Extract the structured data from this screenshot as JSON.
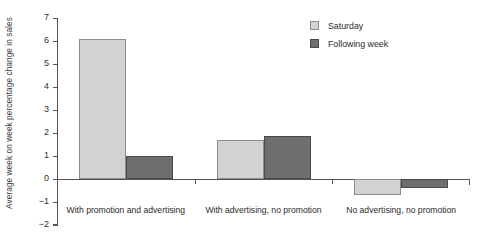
{
  "chart_data": {
    "type": "bar",
    "title": "",
    "subtitle": "",
    "xlabel": "",
    "ylabel": "Average week on week percentage change in sales",
    "categories": [
      "With promotion and advertising",
      "With advertising, no promotion",
      "No advertising, no promotion"
    ],
    "series": [
      {
        "name": "Saturday",
        "color": "#d2d2d2",
        "values": [
          6.1,
          1.7,
          -0.7
        ]
      },
      {
        "name": "Following week",
        "color": "#6e6e6e",
        "values": [
          1.0,
          1.85,
          -0.4
        ]
      }
    ],
    "ylim": [
      -2,
      7
    ],
    "yticks": [
      7,
      6,
      5,
      4,
      3,
      2,
      1,
      0,
      -1,
      -2
    ],
    "ytick_labels": [
      "7",
      "6",
      "5",
      "4",
      "3",
      "2",
      "1",
      "0",
      "−1",
      "−2"
    ],
    "grid": false,
    "legend_position": "top-right",
    "annotations": []
  },
  "legend": {
    "items": [
      {
        "label": "Saturday"
      },
      {
        "label": "Following week"
      }
    ]
  }
}
